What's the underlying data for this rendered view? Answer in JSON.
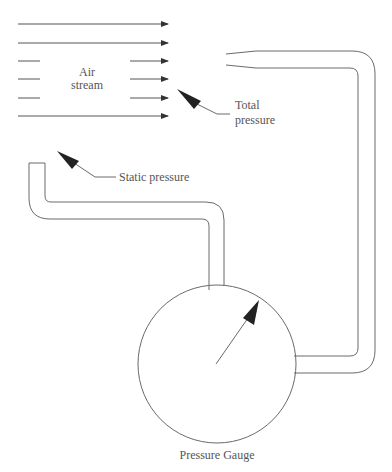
{
  "diagram": {
    "type": "pitot-static tube schematic",
    "labels": {
      "air_stream_line1": "Air",
      "air_stream_line2": "stream",
      "total_pressure_line1": "Total",
      "total_pressure_line2": "pressure",
      "static_pressure": "Static pressure",
      "pressure_gauge": "Pressure Gauge"
    },
    "flow_lines": [
      {
        "y": 24,
        "type": "full"
      },
      {
        "y": 43,
        "type": "full"
      },
      {
        "y": 61,
        "type": "split"
      },
      {
        "y": 79,
        "type": "split"
      },
      {
        "y": 98,
        "type": "split"
      },
      {
        "y": 116,
        "type": "full"
      }
    ],
    "components": [
      {
        "name": "air-stream",
        "description": "flow arrows pointing right"
      },
      {
        "name": "total-pressure-tube",
        "description": "pitot tube facing into flow, connected to gauge right side"
      },
      {
        "name": "static-pressure-tube",
        "description": "tube opening perpendicular to flow, connected to gauge top"
      },
      {
        "name": "pressure-gauge",
        "description": "circular dial with needle"
      }
    ],
    "colors": {
      "stroke": "#6a6a6a",
      "arrowhead": "#222222",
      "text": "#555555",
      "background": "#ffffff"
    }
  }
}
